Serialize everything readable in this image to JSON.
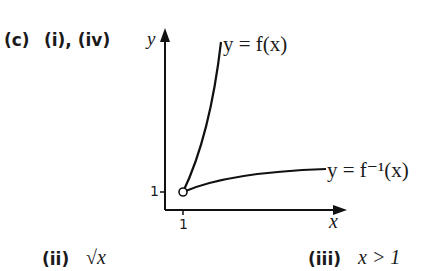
{
  "question": {
    "part_label": "(c)",
    "answer_i_iv": "(i), (iv)",
    "answer_ii_label": "(ii)",
    "answer_ii_value": "√x",
    "answer_iii_label": "(iii)",
    "answer_iii_value": "x > 1"
  },
  "graph": {
    "y_axis_label": "y",
    "x_axis_label": "x",
    "y_tick_label": "1",
    "x_tick_label": "1",
    "curve_f_label": "y = f(x)",
    "curve_finv_label": "y = f⁻¹(x)",
    "open_point": {
      "x": 1,
      "y": 1
    }
  }
}
